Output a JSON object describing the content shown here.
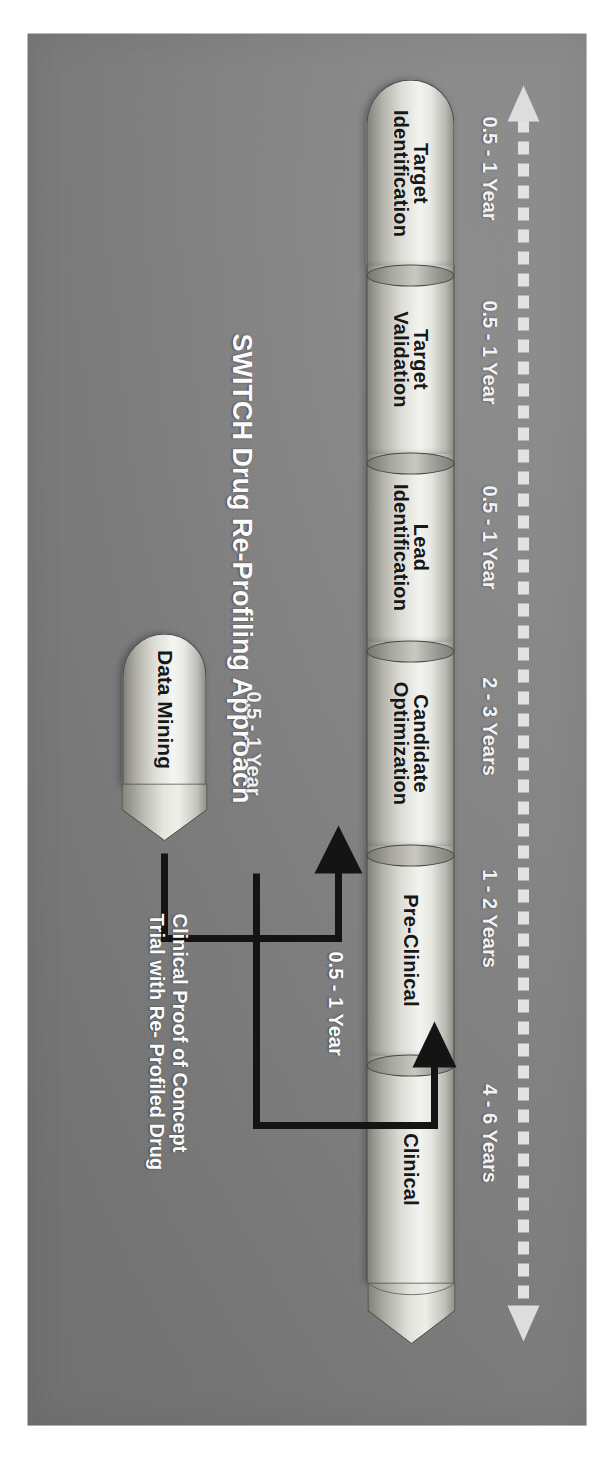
{
  "figure": {
    "title": "SWITCH Drug Re-Profiling Approach",
    "background_color": "#808080",
    "panel_color": "#838383"
  },
  "timeline_arrow": {
    "name": "dashed-double-arrow",
    "style": "dashed",
    "color": "#e0e0e0",
    "heads": "both"
  },
  "pipeline": {
    "stages": [
      {
        "line1": "Target",
        "line2": "Identification",
        "duration": "0.5 - 1 Year"
      },
      {
        "line1": "Target",
        "line2": "Validation",
        "duration": "0.5 - 1 Year"
      },
      {
        "line1": "Lead",
        "line2": "Identification",
        "duration": "0.5 - 1 Year"
      },
      {
        "line1": "Candidate",
        "line2": "Optimization",
        "duration": "2 - 3 Years"
      },
      {
        "line1": "Pre-Clinical",
        "line2": "",
        "duration": "1 - 2 Years"
      },
      {
        "line1": "Clinical",
        "line2": "",
        "duration": "4 - 6 Years"
      }
    ]
  },
  "data_mining": {
    "label": "Data Mining",
    "duration": "0.5 - 1 Year"
  },
  "shortcut": {
    "duration": "0.5 - 1 Year",
    "caption_line1": "Clinical Proof of Concept",
    "caption_line2": "Trial with Re- Profiled Drug"
  }
}
